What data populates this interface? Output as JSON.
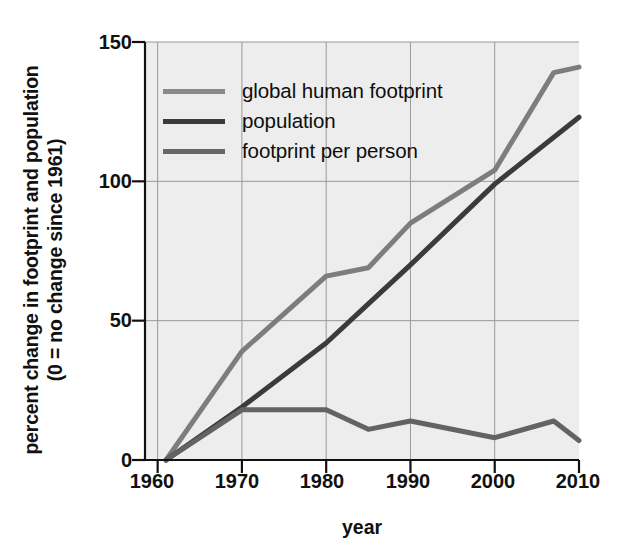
{
  "chart_data": {
    "type": "line",
    "title": "",
    "xlabel": "year",
    "ylabel_line1": "percent change in footprint and population",
    "ylabel_line2": "(0 = no change since 1961)",
    "xlim": [
      1958.5,
      2010
    ],
    "ylim": [
      0,
      150
    ],
    "xticks": [
      1960,
      1970,
      1980,
      1990,
      2000,
      2010
    ],
    "xticklabels": [
      "1960",
      "1970",
      "1980",
      "1990",
      "2000",
      "2010"
    ],
    "yticks": [
      0,
      50,
      100,
      150
    ],
    "yticklabels": [
      "0",
      "50",
      "100",
      "150"
    ],
    "grid": true,
    "grid_color": "#999999",
    "plot_background": "#ededed",
    "legend_position": "upper left",
    "series": [
      {
        "name": "global human footprint",
        "color": "#7d7d7d",
        "linewidth": 5,
        "x": [
          1961,
          1970,
          1980,
          1985,
          1990,
          2000,
          2007,
          2010
        ],
        "y": [
          0,
          39,
          66,
          69,
          85,
          104,
          139,
          141
        ]
      },
      {
        "name": "population",
        "color": "#3b3b3b",
        "linewidth": 5,
        "x": [
          1961,
          1970,
          1980,
          1985,
          1990,
          2000,
          2010
        ],
        "y": [
          0,
          19,
          42,
          56,
          70,
          99,
          123
        ]
      },
      {
        "name": "footprint per person",
        "color": "#636363",
        "linewidth": 5,
        "x": [
          1961,
          1970,
          1980,
          1985,
          1990,
          2000,
          2007,
          2010
        ],
        "y": [
          0,
          18,
          18,
          11,
          14,
          8,
          14,
          7
        ]
      }
    ]
  },
  "legend": {
    "entries": [
      {
        "label": "global human footprint",
        "color": "#8a8a8a"
      },
      {
        "label": "population",
        "color": "#3b3b3b"
      },
      {
        "label": "footprint per person",
        "color": "#666666"
      }
    ]
  },
  "axes": {
    "ylabel_line1": "percent change in footprint and population",
    "ylabel_line2": "(0 = no change since 1961)",
    "xlabel": "year",
    "yticklabels": [
      "150",
      "100",
      "50",
      "0"
    ],
    "xticklabels": [
      "1960",
      "1970",
      "1980",
      "1990",
      "2000",
      "2010"
    ]
  }
}
